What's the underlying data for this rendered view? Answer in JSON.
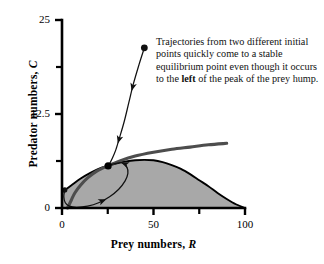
{
  "figure": {
    "annotation": {
      "line1": "Trajectories from two different",
      "line2": "initial points quickly come to a",
      "line3": "stable equilibrium point even",
      "line4_pre": "though it occurs to the ",
      "line4_bold": "left",
      "line4_post": " of",
      "line5": "the peak of the prey hump."
    }
  },
  "chart_data": {
    "type": "line",
    "title": "",
    "xlabel_prefix": "Prey numbers, ",
    "xlabel_italic": "R",
    "ylabel_prefix": "Predator numbers, ",
    "ylabel_italic": "C",
    "xlim": [
      0,
      100
    ],
    "ylim": [
      0,
      25
    ],
    "grid": false,
    "legend": "none",
    "xticks": [
      0,
      50,
      100
    ],
    "xtick_labels": [
      "0",
      "50",
      "100"
    ],
    "x_minor_ticks": [
      25,
      75
    ],
    "yticks": [
      0,
      12.5,
      25
    ],
    "ytick_labels": [
      "0",
      "12.5",
      "25"
    ],
    "y_minor_ticks": [
      6.25,
      18.75
    ],
    "colors": {
      "prey_isocline_fill": "#a8a8a8",
      "prey_isocline_stroke": "#000000",
      "predator_isocline": "#4d4d4d",
      "trajectory": "#111111",
      "axis": "#000000"
    },
    "series": [
      {
        "name": "prey isocline (hump, shaded)",
        "type": "area",
        "points": [
          [
            0,
            2.1
          ],
          [
            5,
            3.0
          ],
          [
            10,
            3.9
          ],
          [
            15,
            4.6
          ],
          [
            20,
            5.2
          ],
          [
            25,
            5.6
          ],
          [
            30,
            5.95
          ],
          [
            35,
            6.2
          ],
          [
            40,
            6.35
          ],
          [
            45,
            6.4
          ],
          [
            50,
            6.35
          ],
          [
            55,
            6.1
          ],
          [
            60,
            5.7
          ],
          [
            65,
            5.2
          ],
          [
            70,
            4.5
          ],
          [
            75,
            3.7
          ],
          [
            80,
            2.9
          ],
          [
            85,
            2.0
          ],
          [
            90,
            1.2
          ],
          [
            95,
            0.5
          ],
          [
            100,
            0.0
          ]
        ]
      },
      {
        "name": "predator isocline (rising gray curve)",
        "type": "line",
        "points": [
          [
            3,
            0.0
          ],
          [
            5,
            1.0
          ],
          [
            7,
            2.0
          ],
          [
            10,
            3.0
          ],
          [
            14,
            4.0
          ],
          [
            19,
            4.9
          ],
          [
            25,
            5.6
          ],
          [
            32,
            6.3
          ],
          [
            40,
            6.9
          ],
          [
            50,
            7.4
          ],
          [
            60,
            7.8
          ],
          [
            70,
            8.1
          ],
          [
            80,
            8.4
          ],
          [
            90,
            8.6
          ]
        ]
      },
      {
        "name": "trajectory from high predator start",
        "type": "line",
        "points": [
          [
            45,
            21.3
          ],
          [
            42,
            19.0
          ],
          [
            39,
            16.5
          ],
          [
            36.5,
            14.0
          ],
          [
            34,
            11.5
          ],
          [
            31.5,
            9.4
          ],
          [
            29.5,
            7.8
          ],
          [
            27.5,
            6.6
          ],
          [
            26,
            5.9
          ],
          [
            25.2,
            5.6
          ]
        ],
        "start_point": [
          45,
          21.3
        ],
        "arrows": [
          [
            38.5,
            16.0
          ],
          [
            31.0,
            9.0
          ]
        ]
      },
      {
        "name": "trajectory from low-left start (spiral)",
        "type": "line",
        "points": [
          [
            1.5,
            2.4
          ],
          [
            1.0,
            1.5
          ],
          [
            1.8,
            0.7
          ],
          [
            4,
            0.25
          ],
          [
            8,
            0.1
          ],
          [
            14,
            0.25
          ],
          [
            20,
            0.7
          ],
          [
            26,
            1.5
          ],
          [
            31,
            2.5
          ],
          [
            34.5,
            3.6
          ],
          [
            36,
            4.6
          ],
          [
            35.5,
            5.4
          ],
          [
            33,
            6.0
          ],
          [
            29.5,
            5.95
          ],
          [
            26.5,
            5.75
          ],
          [
            25.2,
            5.6
          ]
        ],
        "start_point": [
          1.5,
          2.4
        ],
        "arrows": [
          [
            22.5,
            1.0
          ],
          [
            34.0,
            5.9
          ]
        ]
      }
    ],
    "equilibrium_point": [
      25.2,
      5.6
    ],
    "annotations": [
      "Trajectories from two different initial points quickly come to a stable equilibrium point even though it occurs to the left of the peak of the prey hump."
    ]
  }
}
